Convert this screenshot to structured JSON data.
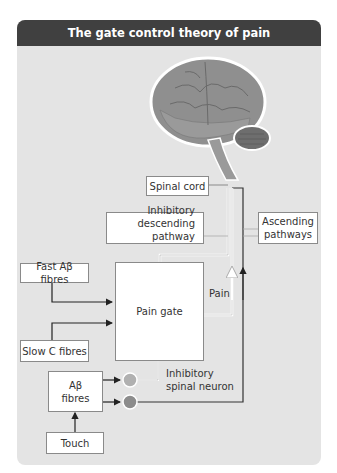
{
  "title": "The gate control theory of pain",
  "colors": {
    "title_bg": "#404040",
    "panel_bg": "#e4e4e4",
    "box_border": "#8a8a8a",
    "pain_line": "#ffffff",
    "inhibitory_neuron": "#b0b0b0",
    "projection_neuron": "#8c8c8c",
    "ascending_line": "#333333"
  },
  "boxes": {
    "spinal_cord": "Spinal cord",
    "inhibitory_descending_line1": "Inhibitory",
    "inhibitory_descending_line2": "descending pathway",
    "ascending_line1": "Ascending",
    "ascending_line2": "pathways",
    "fast_fibres": "Fast Aβ fibres",
    "pain_gate": "Pain gate",
    "slow_fibres": "Slow C fibres",
    "ab_fibres_line1": "Aβ",
    "ab_fibres_line2": "fibres",
    "touch": "Touch"
  },
  "labels": {
    "pain": "Pain",
    "inhibitory_spinal_line1": "Inhibitory",
    "inhibitory_spinal_line2": "spinal neuron"
  },
  "icons": {
    "brain": "brain-illustration",
    "inhibitory_neuron": "gray-circle",
    "projection_neuron": "dark-gray-circle"
  }
}
